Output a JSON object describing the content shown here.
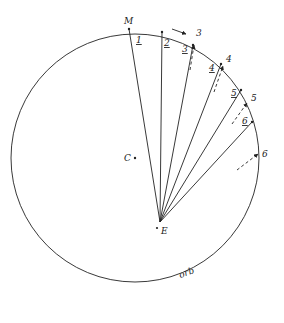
{
  "diagram": {
    "circle": {
      "cx": 135,
      "cy": 158,
      "r": 124,
      "stroke": "#222222"
    },
    "center_point": {
      "label": "C",
      "x": 135,
      "y": 158
    },
    "eccentric_point": {
      "label": "E",
      "x": 160,
      "y": 222
    },
    "orbit_label": "orb",
    "top_label": "M",
    "rays": [
      {
        "label": "1",
        "x": 129,
        "y": 29
      },
      {
        "label": "2",
        "x": 162,
        "y": 32
      },
      {
        "label": "3",
        "x": 193,
        "y": 45
      },
      {
        "label": "4",
        "x": 221,
        "y": 64
      },
      {
        "label": "5",
        "x": 241,
        "y": 90
      },
      {
        "label": "6",
        "x": 252,
        "y": 122
      }
    ],
    "outer_labels": [
      {
        "label": "3",
        "x": 197,
        "y": 37
      },
      {
        "label": "4",
        "x": 227,
        "y": 62
      },
      {
        "label": "5",
        "x": 252,
        "y": 101
      },
      {
        "label": "6",
        "x": 263,
        "y": 157
      }
    ],
    "inner_labels": [
      {
        "label": "1",
        "x": 134,
        "y": 44
      },
      {
        "label": "2",
        "x": 164,
        "y": 47
      },
      {
        "label": "3",
        "x": 183,
        "y": 52
      },
      {
        "label": "4",
        "x": 209,
        "y": 69
      },
      {
        "label": "5",
        "x": 231,
        "y": 95
      },
      {
        "label": "6",
        "x": 242,
        "y": 121
      }
    ],
    "motion_arrow_label": "direction of motion"
  }
}
